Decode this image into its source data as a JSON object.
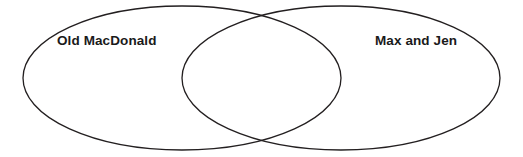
{
  "figure": {
    "type": "venn-diagram",
    "width": 523,
    "height": 157,
    "background_color": "#ffffff",
    "stroke_color": "#231f20",
    "stroke_width": 1.3,
    "fill": "none"
  },
  "sets": {
    "left": {
      "label": "Old MacDonald",
      "center_x": 182,
      "center_y": 78,
      "radius_x": 159,
      "radius_y": 72,
      "label_x": 57,
      "label_y": 34
    },
    "right": {
      "label": "Max and Jen",
      "center_x": 341,
      "center_y": 78,
      "radius_x": 159,
      "radius_y": 72,
      "label_x": 375,
      "label_y": 34
    },
    "overlap": {
      "label": "",
      "top_intersection_x": 262,
      "top_intersection_y": 12,
      "bottom_intersection_x": 262,
      "bottom_intersection_y": 143
    }
  },
  "chart_data": {
    "type": "diagram",
    "diagram_type": "venn",
    "title": "",
    "set_names": [
      "Old MacDonald",
      "Max and Jen"
    ],
    "region_labels": {
      "left_only": "Old MacDonald",
      "right_only": "Max and Jen",
      "intersection": ""
    },
    "items": []
  }
}
